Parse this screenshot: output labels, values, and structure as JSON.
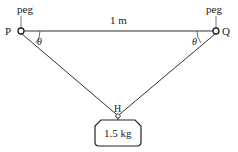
{
  "diagram": {
    "pegs": [
      {
        "id": "P",
        "label": "P",
        "tag": "peg",
        "x": 21,
        "y": 31
      },
      {
        "id": "Q",
        "label": "Q",
        "tag": "peg",
        "x": 216,
        "y": 31
      }
    ],
    "distance_label": "1 m",
    "angle_label": "θ",
    "hook": {
      "label": "H",
      "x": 118,
      "y": 116
    },
    "mass": {
      "label": "1.5 kg"
    },
    "colors": {
      "line": "#333333",
      "text": "#222222",
      "background": "#ffffff"
    }
  }
}
